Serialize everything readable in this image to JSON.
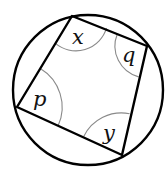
{
  "diagram": {
    "circle": {
      "cx": 88,
      "cy": 90,
      "r": 75,
      "stroke": "#000000"
    },
    "vertices": {
      "top": [
        72,
        16
      ],
      "right": [
        147,
        46
      ],
      "bottom": [
        122,
        155
      ],
      "left": [
        17,
        107
      ]
    },
    "angles": [
      {
        "name": "x",
        "vertex": "top",
        "label": "x",
        "label_pos": [
          77,
          45
        ]
      },
      {
        "name": "q",
        "vertex": "right",
        "label": "q",
        "label_pos": [
          126,
          62
        ]
      },
      {
        "name": "p",
        "vertex": "left",
        "label": "p",
        "label_pos": [
          38,
          106
        ]
      },
      {
        "name": "y",
        "vertex": "bottom",
        "label": "y",
        "label_pos": [
          106,
          138
        ]
      }
    ],
    "arc_color": "#8a8a8a",
    "line_color": "#000000"
  }
}
